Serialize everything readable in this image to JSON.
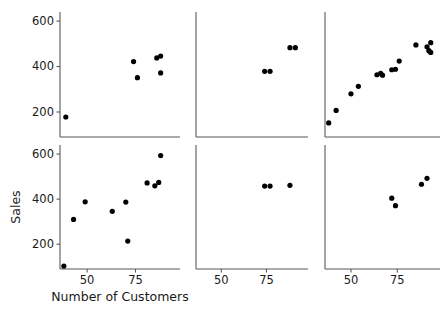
{
  "figure": {
    "title": "",
    "background": "#ffffff",
    "point_color": "#000000",
    "axis_color": "#595959",
    "width": 446,
    "height": 311
  },
  "axis_titles": {
    "x": "Number of Customers",
    "y": "Sales"
  },
  "ticks": {
    "x_labels": [
      "50",
      "75"
    ],
    "x_values": [
      50,
      75
    ],
    "y_labels": [
      "200",
      "400",
      "600"
    ],
    "y_values": [
      200,
      400,
      600
    ]
  },
  "chart_data": {
    "type": "scatter",
    "title": "",
    "xlabel": "Number of Customers",
    "ylabel": "Sales",
    "layout": "2 rows x 3 columns small-multiples scatter matrix",
    "rows": 2,
    "cols": 3,
    "grid": false,
    "legend": "none",
    "xlim": [
      36,
      98
    ],
    "ylim": [
      90,
      640
    ],
    "xticks": [
      50,
      75
    ],
    "yticks": [
      200,
      400,
      600
    ],
    "panels": [
      {
        "panel": "row1-col1",
        "row": 1,
        "col": 1,
        "n_points": 7,
        "points": [
          {
            "x": 39,
            "y": 178
          },
          {
            "x": 74,
            "y": 422
          },
          {
            "x": 76,
            "y": 351
          },
          {
            "x": 86,
            "y": 438
          },
          {
            "x": 88,
            "y": 446
          },
          {
            "x": 88,
            "y": 372
          }
        ]
      },
      {
        "panel": "row1-col2",
        "row": 1,
        "col": 2,
        "n_points": 4,
        "points": [
          {
            "x": 74,
            "y": 379
          },
          {
            "x": 77,
            "y": 379
          },
          {
            "x": 88,
            "y": 483
          },
          {
            "x": 91,
            "y": 483
          }
        ]
      },
      {
        "panel": "row1-col3",
        "row": 1,
        "col": 3,
        "n_points": 15,
        "points": [
          {
            "x": 38,
            "y": 152
          },
          {
            "x": 42,
            "y": 207
          },
          {
            "x": 50,
            "y": 280
          },
          {
            "x": 54,
            "y": 313
          },
          {
            "x": 64,
            "y": 364
          },
          {
            "x": 66,
            "y": 370
          },
          {
            "x": 67,
            "y": 362
          },
          {
            "x": 72,
            "y": 386
          },
          {
            "x": 74,
            "y": 388
          },
          {
            "x": 76,
            "y": 424
          },
          {
            "x": 85,
            "y": 495
          },
          {
            "x": 91,
            "y": 487
          },
          {
            "x": 92,
            "y": 470
          },
          {
            "x": 93,
            "y": 505
          },
          {
            "x": 93,
            "y": 462
          }
        ]
      },
      {
        "panel": "row2-col1",
        "row": 2,
        "col": 1,
        "n_points": 10,
        "points": [
          {
            "x": 38,
            "y": 103
          },
          {
            "x": 43,
            "y": 310
          },
          {
            "x": 49,
            "y": 388
          },
          {
            "x": 63,
            "y": 346
          },
          {
            "x": 70,
            "y": 387
          },
          {
            "x": 71,
            "y": 214
          },
          {
            "x": 81,
            "y": 472
          },
          {
            "x": 85,
            "y": 459
          },
          {
            "x": 87,
            "y": 474
          },
          {
            "x": 88,
            "y": 593
          }
        ]
      },
      {
        "panel": "row2-col2",
        "row": 2,
        "col": 2,
        "n_points": 3,
        "points": [
          {
            "x": 74,
            "y": 458
          },
          {
            "x": 77,
            "y": 458
          },
          {
            "x": 88,
            "y": 461
          }
        ]
      },
      {
        "panel": "row2-col3",
        "row": 2,
        "col": 3,
        "n_points": 4,
        "points": [
          {
            "x": 72,
            "y": 404
          },
          {
            "x": 74,
            "y": 371
          },
          {
            "x": 88,
            "y": 466
          },
          {
            "x": 91,
            "y": 492
          }
        ]
      }
    ]
  }
}
